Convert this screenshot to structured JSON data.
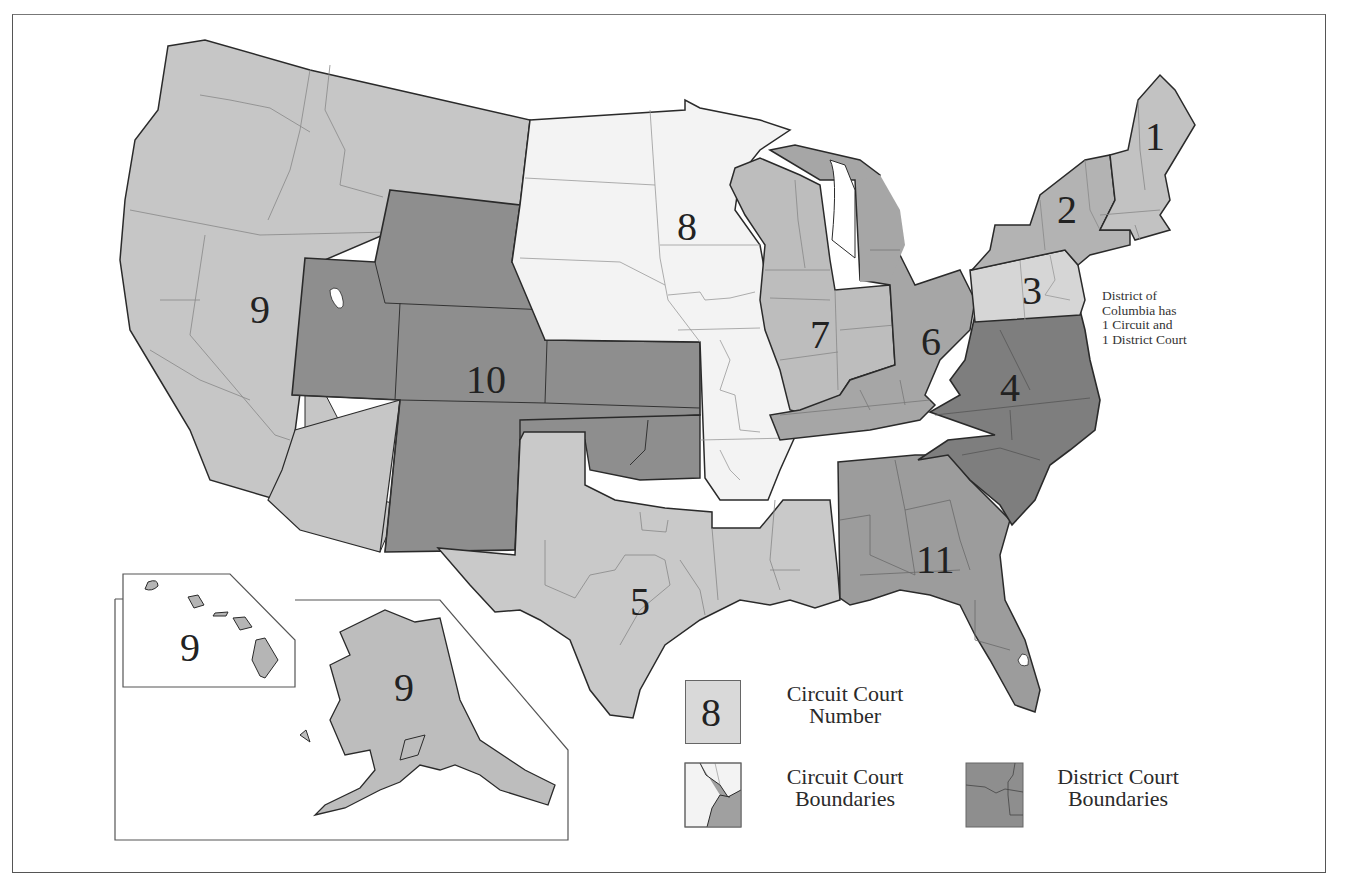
{
  "map": {
    "subject": "U.S. Federal Court Circuits and Districts",
    "colors": {
      "circuit_light": "#c4c4c4",
      "circuit_medium": "#a9a9a9",
      "circuit_dark": "#8c8c8c",
      "circuit_white": "#f3f3f3",
      "circuit_pale": "#d6d6d6",
      "outline": "#2a2a2a",
      "district_line": "#777777"
    },
    "circuits": [
      {
        "number": "1",
        "label": "1",
        "region": "New England (ME, NH, MA, RI)"
      },
      {
        "number": "2",
        "label": "2",
        "region": "NY, VT, CT"
      },
      {
        "number": "3",
        "label": "3",
        "region": "PA, NJ, DE"
      },
      {
        "number": "4",
        "label": "4",
        "region": "MD, VA, WV, NC, SC"
      },
      {
        "number": "5",
        "label": "5",
        "region": "TX, LA, MS"
      },
      {
        "number": "6",
        "label": "6",
        "region": "MI, OH, KY, TN"
      },
      {
        "number": "7",
        "label": "7",
        "region": "WI, IL, IN"
      },
      {
        "number": "8",
        "label": "8",
        "region": "ND, SD, NE, MN, IA, MO, AR"
      },
      {
        "number": "9",
        "label": "9",
        "region": "West coast, NV, ID, MT, AZ"
      },
      {
        "number": "10",
        "label": "10",
        "region": "WY, UT, CO, KS, OK, NM"
      },
      {
        "number": "11",
        "label": "11",
        "region": "AL, GA, FL"
      },
      {
        "number": "9",
        "label": "9",
        "region": "Hawaii inset"
      },
      {
        "number": "9",
        "label": "9",
        "region": "Alaska inset"
      }
    ],
    "dc_note": "District of\nColumbia has\n1 Circuit and\n1 District Court"
  },
  "legend": {
    "items": [
      {
        "swatch_label": "8",
        "line1": "Circuit Court",
        "line2": "Number"
      },
      {
        "line1": "Circuit Court",
        "line2": "Boundaries"
      },
      {
        "line1": "District Court",
        "line2": "Boundaries"
      }
    ]
  }
}
